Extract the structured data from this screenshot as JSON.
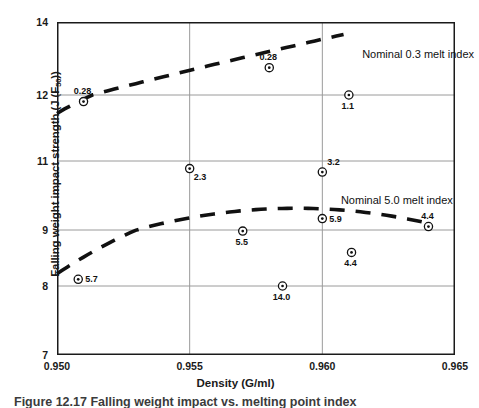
{
  "chart_data": {
    "type": "scatter",
    "title": "",
    "xlabel": "Density (G/ml)",
    "ylabel": "Falling weight impact strength (J (F",
    "ylabel_sub": "50",
    "ylabel_tail": "))",
    "xlim": [
      0.95,
      0.965
    ],
    "xticks": [
      "0.950",
      "0.955",
      "0.960",
      "0.965"
    ],
    "xtick_values": [
      0.95,
      0.955,
      0.96,
      0.965
    ],
    "yticks": [
      "14",
      "12",
      "11",
      "9",
      "8",
      "7"
    ],
    "ytick_values": [
      14,
      12,
      11,
      9,
      8,
      7
    ],
    "ylim": [
      7,
      14
    ],
    "grid": "both",
    "legend": "inline-annotations",
    "marker": "circle-with-center-dot",
    "series": [
      {
        "name": "Nominal 0.3 melt index",
        "annotation": "Nominal 0.3 melt index",
        "trend": "dashed rising line",
        "points": [
          {
            "label": "0.28",
            "x": 0.951,
            "y": 11.9,
            "label_pos": "above"
          },
          {
            "label": "0.28",
            "x": 0.958,
            "y": 12.75,
            "label_pos": "above"
          },
          {
            "label": "1.1",
            "x": 0.961,
            "y": 12.0,
            "label_pos": "below"
          }
        ]
      },
      {
        "name": "Nominal 5.0 melt index",
        "annotation": "Nominal 5.0 melt index",
        "trend": "dashed inverted parabola",
        "points": [
          {
            "label": "5.7",
            "x": 0.9508,
            "y": 8.12,
            "label_pos": "right"
          },
          {
            "label": "2.3",
            "x": 0.955,
            "y": 10.78,
            "label_pos": "below-right"
          },
          {
            "label": "5.5",
            "x": 0.957,
            "y": 8.98,
            "label_pos": "below"
          },
          {
            "label": "14.0",
            "x": 0.9585,
            "y": 8.0,
            "label_pos": "below"
          },
          {
            "label": "3.2",
            "x": 0.96,
            "y": 10.68,
            "label_pos": "above-right"
          },
          {
            "label": "5.9",
            "x": 0.96,
            "y": 9.33,
            "label_pos": "right"
          },
          {
            "label": "4.4",
            "x": 0.9611,
            "y": 8.6,
            "label_pos": "below"
          },
          {
            "label": "4.4",
            "x": 0.964,
            "y": 9.1,
            "label_pos": "above"
          }
        ]
      }
    ],
    "annotations": [
      {
        "text": "Nominal 0.3 melt index",
        "x": 0.9615,
        "y": 13.1
      },
      {
        "text": "Nominal 5.0 melt index",
        "x": 0.9607,
        "y": 9.85
      }
    ],
    "colors": {
      "axis": "#1a1a1a",
      "grid": "#9a9a9a",
      "curve": "#111111",
      "marker": "#111111",
      "text": "#1a1a1a"
    }
  },
  "caption": {
    "text": "Figure 12.17 Falling weight impact vs. melting point index"
  }
}
